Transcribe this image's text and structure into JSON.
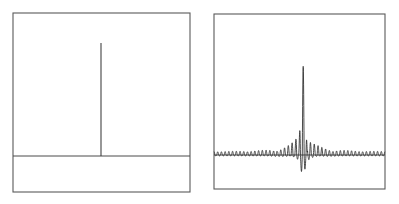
{
  "figure": {
    "title": "",
    "background_color": "#ffffff",
    "width": 399,
    "height": 204,
    "panel_count": 2
  },
  "colors": {
    "frame_stroke": "#5a5a5a",
    "baseline_stroke": "#4a4a4a",
    "signal_stroke": "#2b2b2b",
    "spike_stroke": "#3a3a3a",
    "background": "#ffffff"
  },
  "panels": {
    "left": {
      "name": "spectrum-panel",
      "frame": {
        "x": 13,
        "y": 13,
        "width": 177,
        "height": 179
      },
      "baseline_y": 156,
      "spike": {
        "x": 101,
        "top_y": 43,
        "bottom_y": 156
      }
    },
    "right": {
      "name": "waveform-panel",
      "frame": {
        "x": 214,
        "y": 14,
        "width": 171,
        "height": 175
      },
      "baseline_y": 155,
      "center_x": 303,
      "peak_top_y": 66,
      "trough_bottom_y": 176
    }
  },
  "chart_data": [
    {
      "type": "line",
      "name": "frequency-domain-delta",
      "panel": "left",
      "title": "",
      "subtitle": "",
      "xlabel": "",
      "ylabel": "",
      "legend": [],
      "legend_position": "none",
      "grid": false,
      "axis_frame": "box",
      "tick_labels_x": [],
      "tick_labels_y": [],
      "xlim": [
        0,
        1
      ],
      "ylim": [
        0,
        1
      ],
      "description": "A single narrow impulse (delta function) on a flat zero baseline; the spike rises to near full panel height at the horizontal center.",
      "baseline_value": 0,
      "impulse": {
        "x_fraction": 0.497,
        "height_fraction": 0.79,
        "width_fraction": 0.006
      },
      "x": [
        0.0,
        0.1,
        0.2,
        0.3,
        0.4,
        0.45,
        0.49,
        0.497,
        0.504,
        0.51,
        0.55,
        0.6,
        0.7,
        0.8,
        0.9,
        1.0
      ],
      "values": [
        0,
        0,
        0,
        0,
        0,
        0,
        0,
        0.79,
        0,
        0,
        0,
        0,
        0,
        0,
        0,
        0
      ]
    },
    {
      "type": "line",
      "name": "time-domain-wave-packet",
      "panel": "right",
      "title": "",
      "subtitle": "",
      "xlabel": "",
      "ylabel": "",
      "legend": [],
      "legend_position": "none",
      "grid": false,
      "axis_frame": "box",
      "tick_labels_x": [],
      "tick_labels_y": [],
      "xlim": [
        -1,
        1
      ],
      "ylim": [
        -1,
        1
      ],
      "description": "A carrier oscillation modulated by a sinc-like envelope: tiny uniform ripples across the full width that swell into a tall narrow burst at the center, with the largest positive lobe reaching near the top of the panel and adjacent negative lobes dipping below the baseline.",
      "baseline_value": 0,
      "carrier_cycles_across_panel": 46,
      "envelope": "sinc",
      "envelope_main_lobe_half_width_fraction": 0.05,
      "far_field_ripple_amplitude_fraction": 0.035,
      "peak_amplitude_fraction": 1.0,
      "trough_amplitude_fraction": -0.27
    }
  ]
}
